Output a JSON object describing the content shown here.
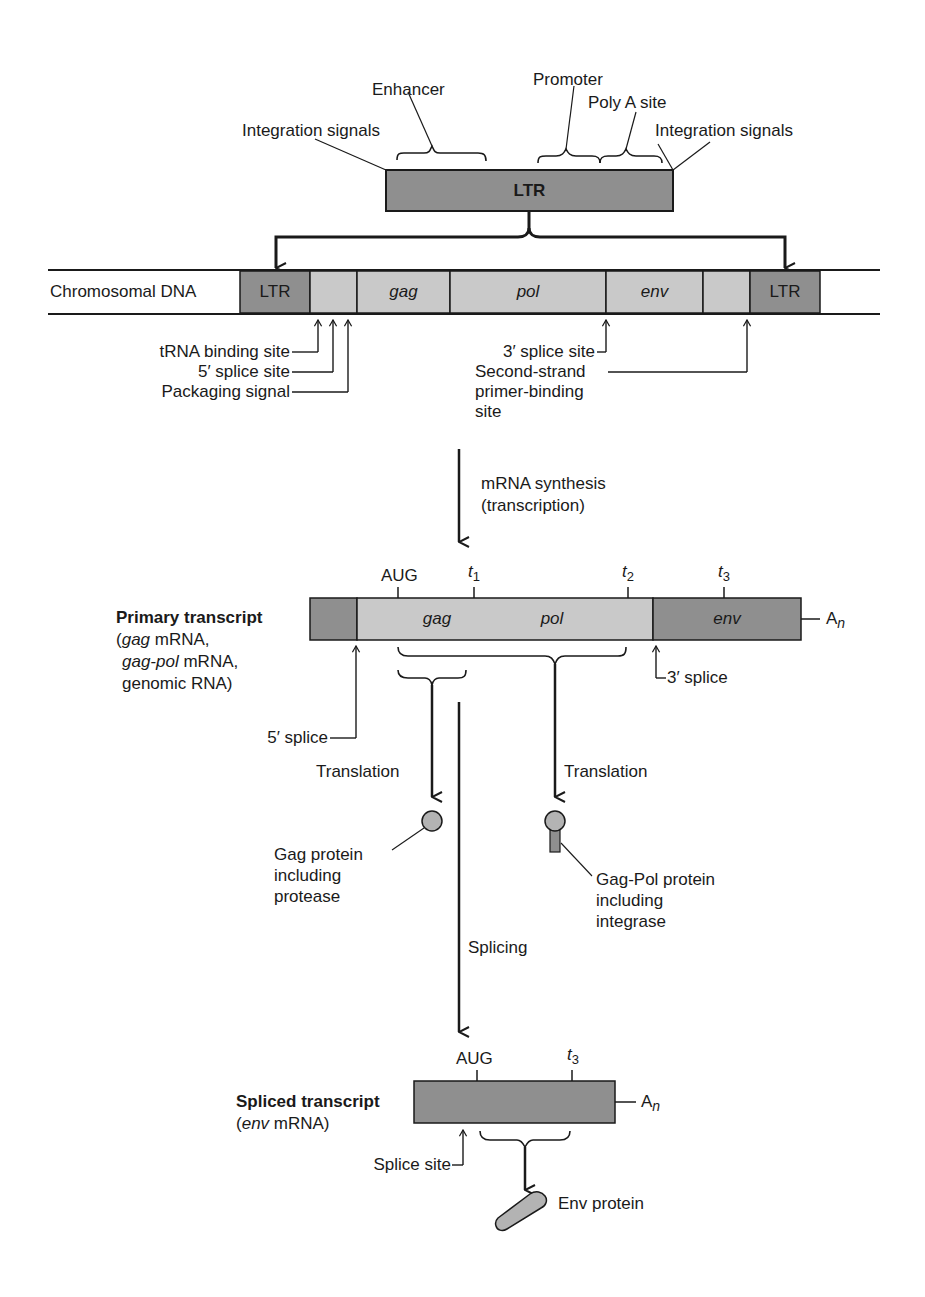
{
  "colors": {
    "ltr_dark": "#8f8f8f",
    "gene_light": "#c9c9c9",
    "env_dark": "#8f8f8f",
    "protein_fill": "#b3b3b3",
    "line": "#1a1a1a"
  },
  "ltr_detail": {
    "box_label": "LTR",
    "labels": {
      "integration_left": "Integration signals",
      "enhancer": "Enhancer",
      "promoter": "Promoter",
      "poly_a": "Poly A site",
      "integration_right": "Integration signals"
    }
  },
  "chromosomal_dna": {
    "label": "Chromosomal DNA",
    "segments": [
      "LTR",
      "",
      "gag",
      "pol",
      "env",
      "",
      "LTR"
    ],
    "sites": {
      "trna": "tRNA binding site",
      "splice5": "5′ splice site",
      "packaging": "Packaging signal",
      "splice3": "3′ splice site",
      "second_strand_1": "Second-strand",
      "second_strand_2": "primer-binding",
      "second_strand_3": "site"
    }
  },
  "transcription": {
    "line1": "mRNA synthesis",
    "line2": "(transcription)"
  },
  "primary_transcript": {
    "title": "Primary transcript",
    "sub1_it": "gag",
    "sub1": " mRNA,",
    "sub2_it": "gag-pol",
    "sub2": " mRNA,",
    "sub3": "genomic RNA)",
    "paren_open": "(",
    "markers": {
      "aug": "AUG",
      "t1": "t",
      "t1_sub": "1",
      "t2": "t",
      "t2_sub": "2",
      "t3": "t",
      "t3_sub": "3"
    },
    "segments": {
      "gag": "gag",
      "pol": "pol",
      "env": "env"
    },
    "poly_a": "A",
    "poly_a_sub": "n",
    "splice5": "5′ splice",
    "splice3": "3′ splice"
  },
  "translation": {
    "left_label": "Translation",
    "right_label": "Translation",
    "gag_protein": [
      "Gag protein",
      "including",
      "protease"
    ],
    "gagpol_protein": [
      "Gag-Pol protein",
      "including",
      "integrase"
    ]
  },
  "splicing": {
    "label": "Splicing"
  },
  "spliced_transcript": {
    "title": "Spliced transcript",
    "sub_it": "env",
    "sub": " mRNA)",
    "paren_open": "(",
    "markers": {
      "aug": "AUG",
      "t3": "t",
      "t3_sub": "3"
    },
    "poly_a": "A",
    "poly_a_sub": "n",
    "splice_site": "Splice site",
    "protein": "Env protein"
  }
}
